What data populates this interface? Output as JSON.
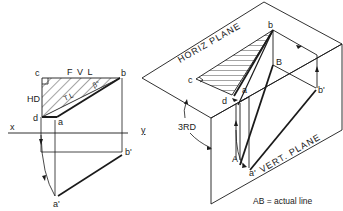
{
  "left_view": {
    "labels": {
      "c": "c",
      "b": "b",
      "d": "d",
      "a": "a",
      "fvl": "F V L",
      "hd": "HD",
      "tl": "T L",
      "beta": "β°",
      "x": "x",
      "y": "y",
      "b_prime": "b'",
      "a_prime": "a'"
    }
  },
  "right_view": {
    "labels": {
      "horiz_plane": "HORIZ PLANE",
      "vert_plane": "VERT. PLANE",
      "b": "b",
      "B": "B",
      "c": "c",
      "d": "d",
      "a": "a",
      "A": "A",
      "a_prime": "a'",
      "b_prime": "b'",
      "third": "3RD"
    }
  },
  "caption": "AB = actual line",
  "colors": {
    "ink": "#1a1a1a",
    "background": "#ffffff"
  }
}
